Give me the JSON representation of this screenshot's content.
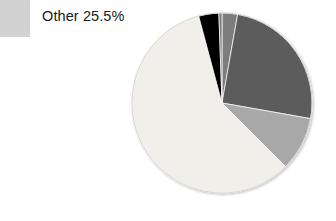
{
  "chart_data": {
    "type": "pie",
    "title": "",
    "xlabel": "",
    "ylabel": "",
    "legend_position": "top-left",
    "grid": false,
    "center": [
      222,
      103
    ],
    "radius": 90,
    "start_angle_deg": 0,
    "direction": "clockwise",
    "labels": [
      "Other",
      "Slice 2",
      "Slice 3",
      "Slice 4",
      "Slice 5"
    ],
    "categories": [
      "Other",
      "Slice 2",
      "Slice 3",
      "Slice 4",
      "Slice 5"
    ],
    "values": [
      58.3,
      2.8,
      25.0,
      9.7,
      4.2
    ],
    "series": [
      {
        "name": "Distribution",
        "values": [
          58.3,
          2.8,
          25.0,
          9.7,
          4.2
        ]
      }
    ],
    "slices": [
      {
        "name": "slice-top-medium-gray",
        "label": "Slice 2",
        "value": 2.8,
        "start_deg": 0,
        "end_deg": 10,
        "color": "#7d7d7d"
      },
      {
        "name": "slice-dark-gray",
        "label": "Slice 3",
        "value": 25.0,
        "start_deg": 10,
        "end_deg": 100,
        "color": "#5c5c5c"
      },
      {
        "name": "slice-medium-light-gray",
        "label": "Slice 4",
        "value": 9.7,
        "start_deg": 100,
        "end_deg": 135,
        "color": "#a8a8a8"
      },
      {
        "name": "slice-other-pale",
        "label": "Other",
        "value": 58.3,
        "start_deg": 135,
        "end_deg": 345,
        "color": "#f0efe9"
      },
      {
        "name": "slice-black",
        "label": "Slice 5",
        "value": 4.2,
        "start_deg": 345,
        "end_deg": 358,
        "color": "#000000"
      },
      {
        "name": "slice-top-medium-gray-wrap",
        "label": "Slice 2",
        "value": 0,
        "start_deg": 358,
        "end_deg": 360,
        "color": "#7d7d7d"
      }
    ],
    "colors": {
      "pale": "#f0efe9",
      "medium_gray": "#7d7d7d",
      "dark_gray": "#5c5c5c",
      "medium_light_gray": "#a8a8a8",
      "black": "#000000",
      "legend_swatch": "#d2d2d2",
      "edge": "#bdbdbd",
      "background": "#ffffff",
      "text": "#1a1a1a"
    }
  },
  "legend": {
    "items": [
      {
        "label": "Other 25.5%",
        "name": "Other",
        "percent": "25.5%",
        "swatch_color": "#d2d2d2"
      }
    ]
  }
}
